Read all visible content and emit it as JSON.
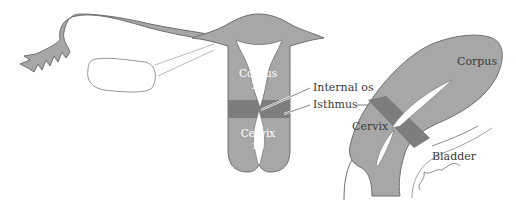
{
  "diagram": {
    "type": "anatomical illustration",
    "colors": {
      "tissue": "#a7a7a7",
      "outline": "#6e6e6e",
      "isthmus_band": "#7d7d7d",
      "cavity": "#ffffff",
      "label_text": "#3a3a3a"
    },
    "front_view": {
      "labels": {
        "corpus": "Corpus",
        "corpus_fraction": "2⁄3",
        "cervix": "Cervix",
        "cervix_fraction": "1⁄3"
      }
    },
    "callouts": {
      "internal_os": "Internal os",
      "isthmus": "Isthmus"
    },
    "side_view": {
      "labels": {
        "corpus": "Corpus",
        "cervix": "Cervix",
        "bladder": "Bladder"
      }
    }
  }
}
